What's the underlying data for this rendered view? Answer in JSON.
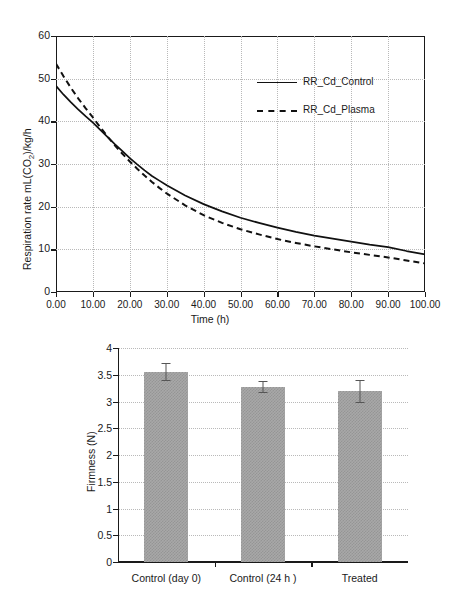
{
  "figure": {
    "title": "",
    "panels": [
      "respiration-rate-line-chart",
      "firmness-bar-chart"
    ]
  },
  "chart_data": [
    {
      "id": "respiration-rate",
      "type": "line",
      "title": "",
      "xlabel": "Time (h)",
      "ylabel": "Respiration rate mL(CO₂)/kg/h",
      "ylabel_parts": {
        "pre": "Respiration rate mL(CO",
        "sub": "2",
        "post": ")/kg/h"
      },
      "xlim": [
        0,
        100
      ],
      "ylim": [
        0,
        60
      ],
      "xticks": [
        0,
        10,
        20,
        30,
        40,
        50,
        60,
        70,
        80,
        90,
        100
      ],
      "xticklabels": [
        "0.00",
        "10.00",
        "20.00",
        "30.00",
        "40.00",
        "50.00",
        "60.00",
        "70.00",
        "80.00",
        "90.00",
        "100.00"
      ],
      "yticks": [
        0,
        10,
        20,
        30,
        40,
        50,
        60
      ],
      "yticklabels": [
        "0",
        "10",
        "20",
        "30",
        "40",
        "50",
        "60"
      ],
      "grid": true,
      "grid_style": "dotted",
      "legend_position": "upper-right",
      "series": [
        {
          "name": "RR_Cd_Control",
          "style": "solid",
          "color": "#111111",
          "x": [
            0,
            2,
            4,
            6,
            8,
            10,
            12,
            14,
            16,
            18,
            20,
            22,
            24,
            26,
            28,
            30,
            35,
            40,
            45,
            50,
            55,
            60,
            65,
            70,
            75,
            80,
            85,
            90,
            95,
            100
          ],
          "y": [
            48.3,
            46.3,
            44.5,
            42.8,
            41.2,
            39.7,
            38.0,
            36.3,
            34.6,
            33.0,
            31.4,
            29.9,
            28.5,
            27.2,
            26.1,
            25.0,
            22.6,
            20.6,
            18.9,
            17.4,
            16.2,
            15.1,
            14.1,
            13.2,
            12.5,
            11.8,
            11.1,
            10.5,
            9.6,
            8.8
          ]
        },
        {
          "name": "RR_Cd_Plasma",
          "style": "dashed",
          "color": "#111111",
          "x": [
            0,
            2,
            4,
            6,
            8,
            10,
            12,
            14,
            16,
            18,
            20,
            22,
            24,
            26,
            28,
            30,
            35,
            40,
            45,
            50,
            55,
            60,
            65,
            70,
            75,
            80,
            85,
            90,
            95,
            100
          ],
          "y": [
            53.5,
            50.6,
            47.9,
            45.4,
            43.1,
            40.9,
            38.6,
            36.4,
            34.3,
            32.4,
            30.6,
            28.9,
            27.3,
            25.8,
            24.4,
            23.1,
            20.3,
            18.0,
            16.2,
            14.7,
            13.5,
            12.4,
            11.5,
            10.7,
            10.0,
            9.3,
            8.7,
            8.1,
            7.4,
            6.7
          ]
        }
      ]
    },
    {
      "id": "firmness",
      "type": "bar",
      "title": "",
      "xlabel": "",
      "ylabel": "Firmness (N)",
      "ylim": [
        0,
        4
      ],
      "yticks": [
        0,
        0.5,
        1,
        1.5,
        2,
        2.5,
        3,
        3.5,
        4
      ],
      "yticklabels": [
        "0",
        "0.5",
        "1",
        "1.5",
        "2",
        "2.5",
        "3",
        "3.5",
        "4"
      ],
      "grid": true,
      "grid_style": "dotted",
      "categories": [
        "Control (day 0)",
        "Control (24 h )",
        "Treated"
      ],
      "values": [
        3.55,
        3.27,
        3.19
      ],
      "errors": [
        0.17,
        0.11,
        0.21
      ],
      "bar_color": "#a8a8a8",
      "bar_pattern": "fine-checker",
      "error_bar_color": "#555555"
    }
  ]
}
